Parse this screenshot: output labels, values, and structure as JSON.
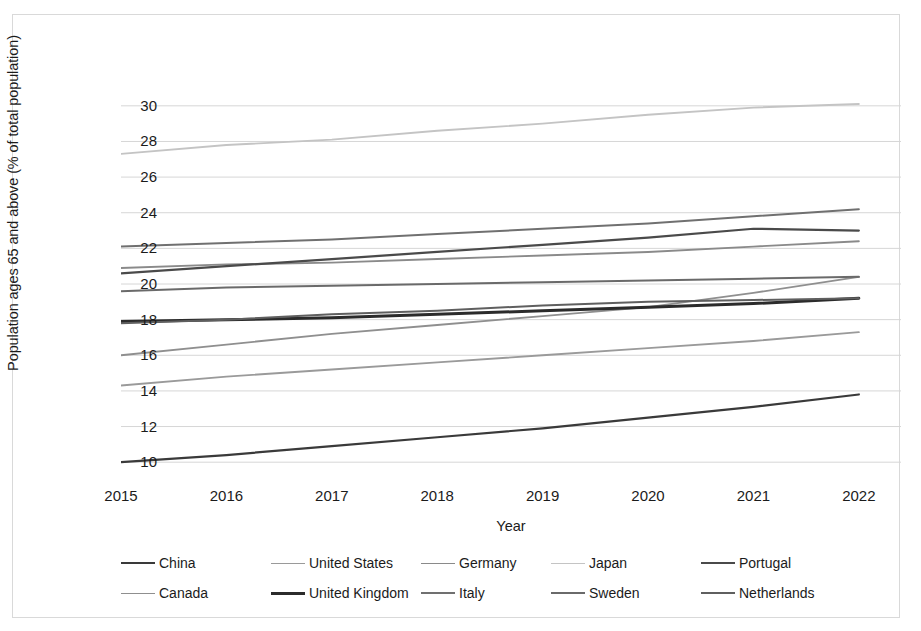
{
  "chart_data": {
    "type": "line",
    "title": "",
    "xlabel": "Year",
    "ylabel": "Population ages 65 and above (% of total population)",
    "x": [
      2015,
      2016,
      2017,
      2018,
      2019,
      2020,
      2021,
      2022
    ],
    "x_ticks": [
      "2015",
      "2016",
      "2017",
      "2018",
      "2019",
      "2020",
      "2021",
      "2022"
    ],
    "y_ticks": [
      "10",
      "12",
      "14",
      "16",
      "18",
      "20",
      "22",
      "24",
      "26",
      "28",
      "30"
    ],
    "ylim": [
      9,
      31
    ],
    "xlim": [
      2015,
      2022.4
    ],
    "grid": "horizontal",
    "legend_position": "bottom",
    "series": [
      {
        "name": "China",
        "color": "#3a3a3a",
        "width": 2.2,
        "values": [
          10.0,
          10.4,
          10.9,
          11.4,
          11.9,
          12.5,
          13.1,
          13.8
        ]
      },
      {
        "name": "United States",
        "color": "#9a9a9a",
        "width": 1.9,
        "values": [
          14.3,
          14.8,
          15.2,
          15.6,
          16.0,
          16.4,
          16.8,
          17.3
        ]
      },
      {
        "name": "Germany",
        "color": "#8a8a8a",
        "width": 1.9,
        "values": [
          20.9,
          21.1,
          21.2,
          21.4,
          21.6,
          21.8,
          22.1,
          22.4
        ]
      },
      {
        "name": "Japan",
        "color": "#c4c4c4",
        "width": 1.9,
        "values": [
          27.3,
          27.8,
          28.1,
          28.6,
          29.0,
          29.5,
          29.9,
          30.1
        ]
      },
      {
        "name": "Portugal",
        "color": "#4a4a4a",
        "width": 2.2,
        "values": [
          20.6,
          21.0,
          21.4,
          21.8,
          22.2,
          22.6,
          23.1,
          23.0
        ]
      },
      {
        "name": "Canada",
        "color": "#8f8f8f",
        "width": 1.9,
        "values": [
          16.0,
          16.6,
          17.2,
          17.7,
          18.2,
          18.7,
          19.5,
          20.4
        ]
      },
      {
        "name": "United Kingdom",
        "color": "#2b2b2b",
        "width": 3.0,
        "values": [
          17.9,
          18.0,
          18.1,
          18.3,
          18.5,
          18.7,
          18.9,
          19.2
        ]
      },
      {
        "name": "Italy",
        "color": "#707070",
        "width": 2.0,
        "values": [
          22.1,
          22.3,
          22.5,
          22.8,
          23.1,
          23.4,
          23.8,
          24.2
        ]
      },
      {
        "name": "Sweden",
        "color": "#6a6a6a",
        "width": 2.0,
        "values": [
          19.6,
          19.8,
          19.9,
          20.0,
          20.1,
          20.2,
          20.3,
          20.4
        ]
      },
      {
        "name": "Netherlands",
        "color": "#5f5f5f",
        "width": 2.0,
        "values": [
          17.8,
          18.0,
          18.3,
          18.5,
          18.8,
          19.0,
          19.1,
          19.2
        ]
      }
    ]
  },
  "axes": {
    "y_title": "Population ages 65 and above (% of total population)",
    "x_title": "Year"
  },
  "legend": {
    "rows": [
      [
        {
          "label": "China",
          "color": "#3a3a3a",
          "width": 2.2
        },
        {
          "label": "United States",
          "color": "#9a9a9a",
          "width": 1.9
        },
        {
          "label": "Germany",
          "color": "#8a8a8a",
          "width": 1.9
        },
        {
          "label": "Japan",
          "color": "#c4c4c4",
          "width": 1.9
        },
        {
          "label": "Portugal",
          "color": "#4a4a4a",
          "width": 2.2
        }
      ],
      [
        {
          "label": "Canada",
          "color": "#8f8f8f",
          "width": 1.9
        },
        {
          "label": "United Kingdom",
          "color": "#2b2b2b",
          "width": 3.0
        },
        {
          "label": "Italy",
          "color": "#707070",
          "width": 2.0
        },
        {
          "label": "Sweden",
          "color": "#6a6a6a",
          "width": 2.0
        },
        {
          "label": "Netherlands",
          "color": "#5f5f5f",
          "width": 2.0
        }
      ]
    ]
  },
  "style": {
    "grid_color": "#d6d6d6",
    "frame_color": "#d9d9d9",
    "text_color": "#1b1b1b"
  }
}
